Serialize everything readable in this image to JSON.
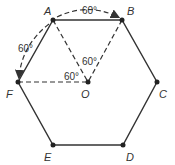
{
  "diagram": {
    "type": "regular hexagon with center",
    "vertices": [
      {
        "name": "A",
        "label": "A",
        "x": 53,
        "y": 20,
        "lx": 44,
        "ly": 15
      },
      {
        "name": "B",
        "label": "B",
        "x": 122,
        "y": 20,
        "lx": 127,
        "ly": 15
      },
      {
        "name": "C",
        "label": "C",
        "x": 157,
        "y": 82,
        "lx": 159,
        "ly": 98
      },
      {
        "name": "D",
        "label": "D",
        "x": 123,
        "y": 145,
        "lx": 126,
        "ly": 161
      },
      {
        "name": "E",
        "label": "E",
        "x": 53,
        "y": 145,
        "lx": 44,
        "ly": 161
      },
      {
        "name": "F",
        "label": "F",
        "x": 18,
        "y": 82,
        "lx": 6,
        "ly": 98
      }
    ],
    "center": {
      "name": "O",
      "label": "O",
      "x": 88,
      "y": 82,
      "lx": 81,
      "ly": 98
    },
    "angle_labels": [
      {
        "text": "60°",
        "x": 82,
        "y": 14,
        "desc": "arc A to B"
      },
      {
        "text": "60°",
        "x": 18,
        "y": 52,
        "desc": "arc A to F"
      },
      {
        "text": "60°",
        "x": 82,
        "y": 65,
        "desc": "angle AOB"
      },
      {
        "text": "60°",
        "x": 64,
        "y": 80,
        "desc": "angle FOA"
      }
    ],
    "colors": {
      "stroke": "#333333",
      "point": "#222222"
    }
  }
}
